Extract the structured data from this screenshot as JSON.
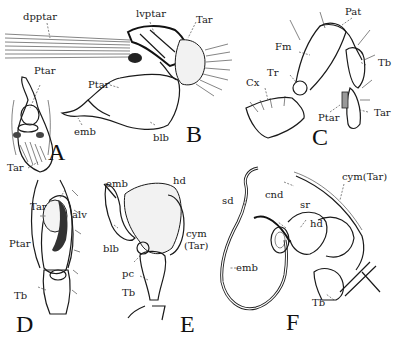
{
  "figure": {
    "panels": [
      {
        "id": "A",
        "letter": "A",
        "labels": [
          {
            "text": "Ptar"
          },
          {
            "text": "Tar"
          }
        ]
      },
      {
        "id": "B",
        "letter": "B",
        "labels": [
          {
            "text": "dpptar"
          },
          {
            "text": "lvptar"
          },
          {
            "text": "Tar"
          },
          {
            "text": "Ptar"
          },
          {
            "text": "emb"
          },
          {
            "text": "blb"
          }
        ]
      },
      {
        "id": "C",
        "letter": "C",
        "labels": [
          {
            "text": "Pat"
          },
          {
            "text": "Fm"
          },
          {
            "text": "Tb"
          },
          {
            "text": "Tr"
          },
          {
            "text": "Cx"
          },
          {
            "text": "Ptar"
          },
          {
            "text": "Tar"
          }
        ]
      },
      {
        "id": "D",
        "letter": "D",
        "labels": [
          {
            "text": "Tar"
          },
          {
            "text": "alv"
          },
          {
            "text": "Ptar"
          },
          {
            "text": "Tb"
          }
        ]
      },
      {
        "id": "E",
        "letter": "E",
        "labels": [
          {
            "text": "emb"
          },
          {
            "text": "hd"
          },
          {
            "text": "blb"
          },
          {
            "text": "cym"
          },
          {
            "text": "(Tar)"
          },
          {
            "text": "pc"
          },
          {
            "text": "Tb"
          }
        ]
      },
      {
        "id": "F",
        "letter": "F",
        "labels": [
          {
            "text": "cym(Tar)"
          },
          {
            "text": "sd"
          },
          {
            "text": "cnd"
          },
          {
            "text": "sr"
          },
          {
            "text": "hd"
          },
          {
            "text": "emb"
          },
          {
            "text": "Tb"
          }
        ]
      }
    ]
  }
}
